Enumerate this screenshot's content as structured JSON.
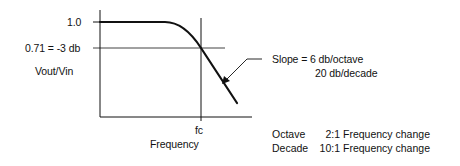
{
  "diagram": {
    "type": "low-pass filter frequency response",
    "y_axis": {
      "label": "Vout/Vin",
      "ticks": [
        {
          "label": "1.0",
          "value": 1.0
        },
        {
          "label": "0.71 = -3 db",
          "value": 0.71
        }
      ]
    },
    "x_axis": {
      "label": "Frequency",
      "ticks": [
        {
          "label": "fc"
        }
      ]
    },
    "annotation": {
      "line1": "Slope = 6 db/octave",
      "line2": "20 db/decade"
    },
    "legend": [
      {
        "term": "Octave",
        "ratio": "2:1",
        "description": "Frequency change"
      },
      {
        "term": "Decade",
        "ratio": "10:1",
        "description": "Frequency change"
      }
    ],
    "colors": {
      "ink": "#111111",
      "background": "#ffffff"
    }
  }
}
